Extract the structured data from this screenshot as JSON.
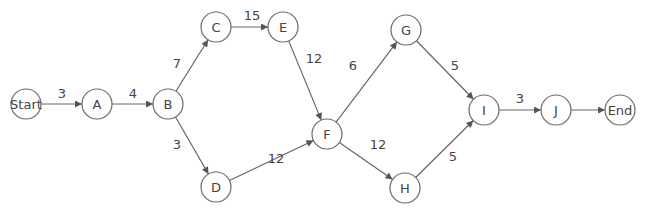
{
  "diagram": {
    "type": "network-activity-diagram",
    "colors": {
      "stroke": "#666666",
      "text": "#444444",
      "background": "#ffffff"
    },
    "nodes": [
      {
        "id": "Start",
        "label": "Start",
        "x": 26,
        "y": 104
      },
      {
        "id": "A",
        "label": "A",
        "x": 97,
        "y": 104
      },
      {
        "id": "B",
        "label": "B",
        "x": 168,
        "y": 104
      },
      {
        "id": "C",
        "label": "C",
        "x": 216,
        "y": 27
      },
      {
        "id": "E",
        "label": "E",
        "x": 283,
        "y": 27
      },
      {
        "id": "D",
        "label": "D",
        "x": 216,
        "y": 187
      },
      {
        "id": "F",
        "label": "F",
        "x": 327,
        "y": 134
      },
      {
        "id": "G",
        "label": "G",
        "x": 406,
        "y": 30
      },
      {
        "id": "H",
        "label": "H",
        "x": 405,
        "y": 188
      },
      {
        "id": "I",
        "label": "I",
        "x": 484,
        "y": 110
      },
      {
        "id": "J",
        "label": "J",
        "x": 556,
        "y": 110
      },
      {
        "id": "End",
        "label": "End",
        "x": 620,
        "y": 110
      }
    ],
    "edges": [
      {
        "from": "Start",
        "to": "A",
        "weight": "3",
        "lx": 62,
        "ly": 93
      },
      {
        "from": "A",
        "to": "B",
        "weight": "4",
        "lx": 133,
        "ly": 93
      },
      {
        "from": "B",
        "to": "C",
        "weight": "7",
        "lx": 177,
        "ly": 63
      },
      {
        "from": "B",
        "to": "D",
        "weight": "3",
        "lx": 177,
        "ly": 144
      },
      {
        "from": "C",
        "to": "E",
        "weight": "15",
        "lx": 252,
        "ly": 15
      },
      {
        "from": "E",
        "to": "F",
        "weight": "12",
        "lx": 314,
        "ly": 58
      },
      {
        "from": "D",
        "to": "F",
        "weight": "12",
        "lx": 276,
        "ly": 158
      },
      {
        "from": "F",
        "to": "G",
        "weight": "6",
        "lx": 353,
        "ly": 65
      },
      {
        "from": "F",
        "to": "H",
        "weight": "12",
        "lx": 378,
        "ly": 144
      },
      {
        "from": "G",
        "to": "I",
        "weight": "5",
        "lx": 455,
        "ly": 65
      },
      {
        "from": "H",
        "to": "I",
        "weight": "5",
        "lx": 453,
        "ly": 156
      },
      {
        "from": "I",
        "to": "J",
        "weight": "3",
        "lx": 520,
        "ly": 98
      },
      {
        "from": "J",
        "to": "End",
        "weight": "",
        "lx": 588,
        "ly": 98
      }
    ]
  }
}
